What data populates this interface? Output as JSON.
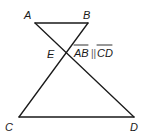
{
  "diagram": {
    "type": "geometry",
    "points": {
      "A": {
        "label": "A",
        "x": 35,
        "y": 23
      },
      "B": {
        "label": "B",
        "x": 88,
        "y": 23
      },
      "E": {
        "label": "E",
        "x": 68,
        "y": 53
      },
      "C": {
        "label": "C",
        "x": 19,
        "y": 117
      },
      "D": {
        "label": "D",
        "x": 134,
        "y": 117
      }
    },
    "segments": [
      {
        "from": "A",
        "to": "B"
      },
      {
        "from": "A",
        "to": "D"
      },
      {
        "from": "B",
        "to": "C"
      },
      {
        "from": "C",
        "to": "D"
      }
    ],
    "annotation": {
      "seg1": "AB",
      "parallel_symbol": "||",
      "seg2": "CD"
    },
    "line_color": "#1a1a1a"
  }
}
